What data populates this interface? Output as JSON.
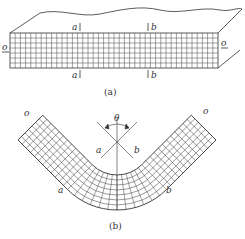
{
  "figure_a": {
    "caption": "(a)",
    "labels": {
      "top_a": "a",
      "top_b": "b",
      "bottom_a": "a",
      "bottom_b": "b",
      "left_o": "o",
      "right_o": "o"
    },
    "grid": {
      "rows": 7,
      "cols": 40
    }
  },
  "figure_b": {
    "caption": "(b)",
    "labels": {
      "theta": "θ",
      "inner_a": "a",
      "inner_b": "b",
      "outer_a": "a",
      "outer_b": "b",
      "left_o": "o",
      "right_o": "o"
    }
  },
  "colors": {
    "line": "#333333",
    "grid": "#444444"
  }
}
